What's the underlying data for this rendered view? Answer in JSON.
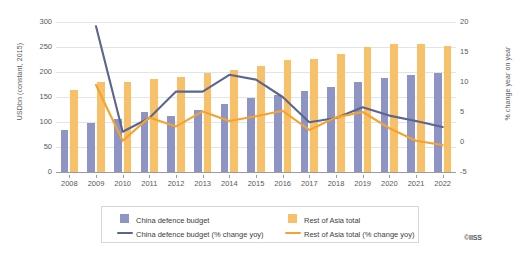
{
  "credit": "©IISS",
  "legend": {
    "items": [
      {
        "label": "China defence budget",
        "type": "swatch",
        "color": "#8e94c4"
      },
      {
        "label": "Rest of Asia total",
        "type": "swatch",
        "color": "#f9c06a"
      },
      {
        "label": "China defence budget (% change yoy)",
        "type": "line",
        "color": "#5b6591"
      },
      {
        "label": "Rest of Asia total (% change yoy)",
        "type": "line",
        "color": "#f5a22e"
      }
    ]
  },
  "chart_data": {
    "type": "bar",
    "title": "",
    "subtitle": "",
    "xlabel": "",
    "ylabel": "USDbn (constant, 2015)",
    "y2label": "% change year on year",
    "categories": [
      "2008",
      "2009",
      "2010",
      "2011",
      "2012",
      "2013",
      "2014",
      "2015",
      "2016",
      "2017",
      "2018",
      "2019",
      "2020",
      "2021",
      "2022"
    ],
    "ylim": [
      0,
      300
    ],
    "y2lim": [
      -5,
      20
    ],
    "yticks": [
      0,
      50,
      100,
      150,
      200,
      250,
      300
    ],
    "y2ticks": [
      -5,
      0,
      5,
      10,
      15,
      20
    ],
    "grid": true,
    "legend_position": "bottom",
    "series": [
      {
        "name": "China defence budget",
        "kind": "bar",
        "axis": "left",
        "unit": "USDbn (constant, 2015)",
        "color": "#8e94c4",
        "values": [
          84,
          99,
          107,
          120,
          113,
          124,
          136,
          148,
          155,
          163,
          170,
          181,
          188,
          195,
          199
        ]
      },
      {
        "name": "Rest of Asia total",
        "kind": "bar",
        "axis": "left",
        "unit": "USDbn (constant, 2015)",
        "color": "#f9c06a",
        "values": [
          165,
          181,
          181,
          187,
          190,
          199,
          205,
          213,
          224,
          227,
          236,
          250,
          256,
          257,
          253
        ]
      },
      {
        "name": "China defence budget (% change yoy)",
        "kind": "line",
        "axis": "right",
        "unit": "% change year on year",
        "color": "#5b6591",
        "values": [
          null,
          19.3,
          1.7,
          4.0,
          8.4,
          8.4,
          11.2,
          10.4,
          7.5,
          3.3,
          4.0,
          5.8,
          4.4,
          3.5,
          2.5
        ]
      },
      {
        "name": "Rest of Asia total (% change yoy)",
        "kind": "line",
        "axis": "right",
        "unit": "% change year on year",
        "color": "#f5a22e",
        "values": [
          null,
          9.5,
          0.2,
          4.1,
          2.6,
          5.1,
          3.5,
          4.3,
          5.2,
          2.0,
          4.1,
          5.0,
          2.3,
          0.2,
          -0.5
        ]
      }
    ]
  }
}
